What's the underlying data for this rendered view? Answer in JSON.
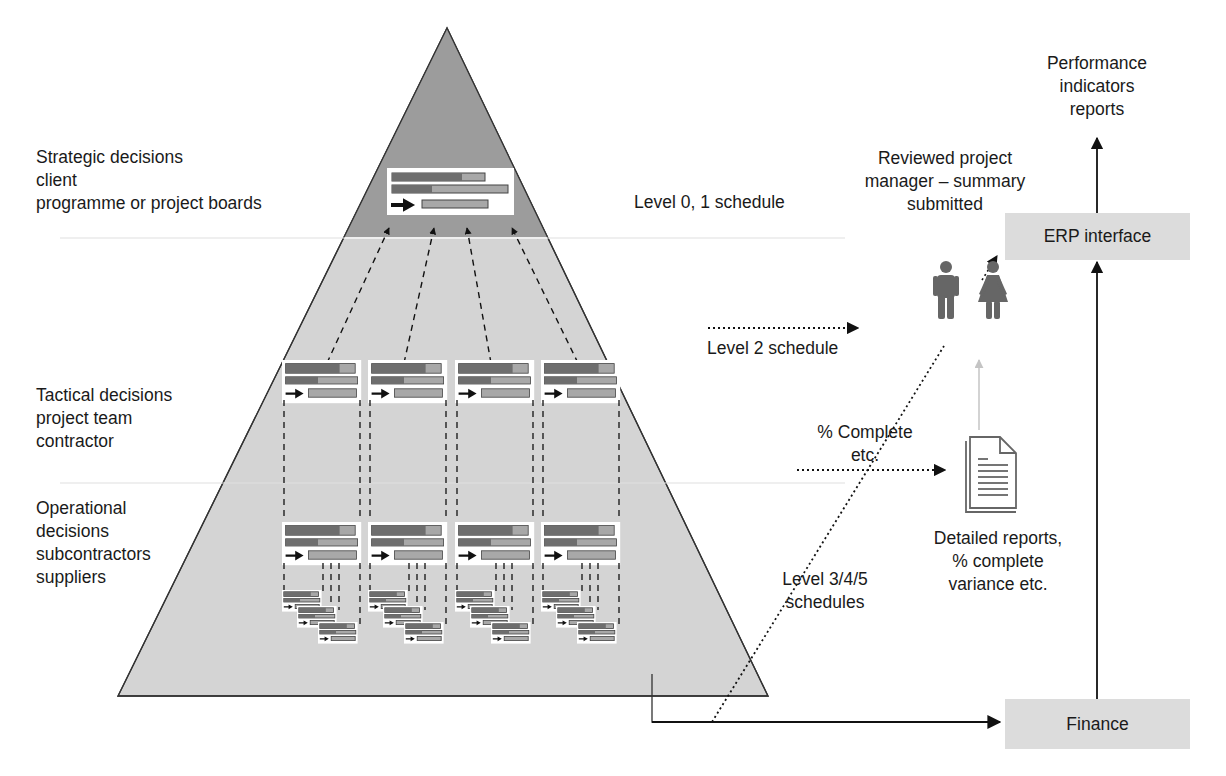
{
  "diagram": {
    "title_labels": {
      "strategic": [
        "Strategic decisions",
        "client",
        "programme or project boards"
      ],
      "tactical": [
        "Tactical decisions",
        "project team",
        "contractor"
      ],
      "operational": [
        "Operational",
        "decisions",
        "subcontractors",
        "suppliers"
      ]
    },
    "schedule_labels": {
      "level01": "Level 0, 1 schedule",
      "level2": "Level 2 schedule",
      "level345": [
        "Level 3/4/5",
        "schedules"
      ]
    },
    "flow_labels": {
      "percent_complete": [
        "% Complete",
        "etc."
      ],
      "reviewed": [
        "Reviewed project",
        "manager – summary",
        "submitted"
      ],
      "performance": [
        "Performance",
        "indicators",
        "reports"
      ],
      "detailed_reports": [
        "Detailed reports,",
        "% complete",
        "variance etc."
      ]
    },
    "boxes": {
      "erp": "ERP interface",
      "finance": "Finance"
    },
    "icons": {
      "people": "man-woman-icon",
      "document": "document-icon"
    },
    "colors": {
      "pyramid_top": "#9c9c9c",
      "pyramid_body": "#d4d4d4",
      "bar_dark": "#6e6e6e",
      "bar_light": "#a8a8a8",
      "box_fill": "#dcdcdc",
      "icon": "#666666",
      "faded_arrow": "#c4c4c4"
    }
  }
}
